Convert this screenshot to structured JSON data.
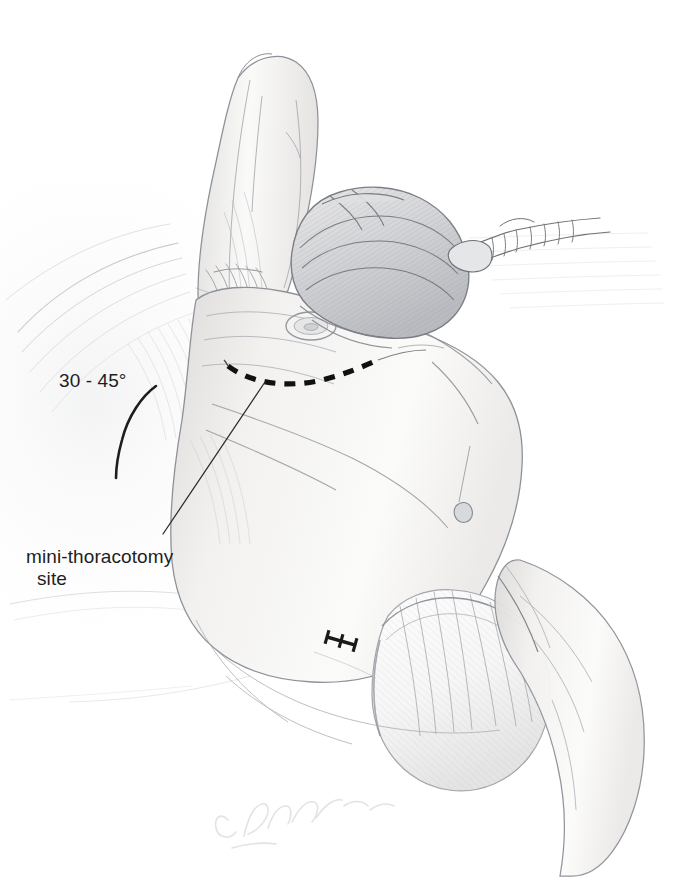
{
  "figure": {
    "medium": "graphite pencil illustration",
    "background_color": "#ffffff",
    "ink_color": "#1e1e1e",
    "pencil_color": "#8c8f96",
    "pencil_light_color": "#c9ccd2",
    "skin_tone": "#f4f3f1"
  },
  "annotations": {
    "angle": {
      "label": "30 - 45°",
      "icon": "angle-arc-icon",
      "description": "arc indicating table tilt / patient roll angle"
    },
    "site": {
      "label_line_1": "mini-thoracotomy",
      "label_line_2": "site",
      "icon": "leader-line-icon",
      "description": "leader line pointing to the dashed incision mark on the lateral chest"
    }
  },
  "markings": {
    "incision": {
      "name": "dashed-incision-line",
      "style": "dashed",
      "color": "#111111",
      "dash_count": 8,
      "description": "planned mini-thoracotomy incision on lateral chest wall"
    },
    "staples": {
      "name": "suture-marks",
      "count": 3,
      "color": "#1a1a1a",
      "description": "three H-shaped staple / port closure marks on the flank"
    }
  },
  "anatomy": [
    {
      "name": "raised-arm",
      "label": "Arm abducted above head"
    },
    {
      "name": "axilla",
      "label": "Axilla"
    },
    {
      "name": "nipple-areola",
      "label": "Nipple / areola"
    },
    {
      "name": "lateral-chest",
      "label": "Lateral chest wall"
    },
    {
      "name": "umbilicus",
      "label": "Umbilicus"
    },
    {
      "name": "abdomen",
      "label": "Abdomen"
    },
    {
      "name": "hip-thigh",
      "label": "Hip and thigh"
    }
  ],
  "equipment": [
    {
      "name": "head-drape",
      "label": "Surgical drape over head"
    },
    {
      "name": "anesthesia-tubing",
      "label": "Corrugated anesthesia circuit tubing"
    },
    {
      "name": "lower-body-drape",
      "label": "White surgical drape over pelvis"
    },
    {
      "name": "table-drape",
      "label": "Draped operating table"
    }
  ],
  "signature": {
    "name": "artist-signature",
    "visible": true,
    "description": "faint handwritten artist signature at lower centre"
  }
}
